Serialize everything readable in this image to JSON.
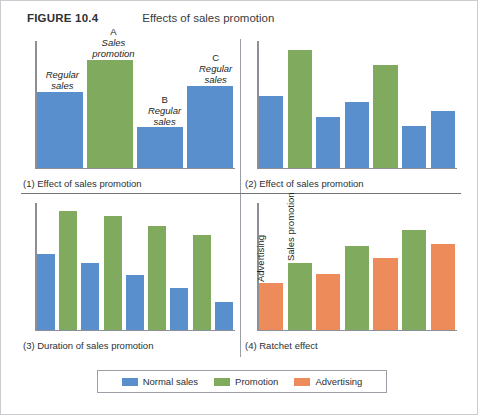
{
  "header": {
    "figure_number": "FIGURE 10.4",
    "title": "Effects of sales promotion"
  },
  "colors": {
    "normal_sales": "#5a8fcd",
    "promotion": "#80ab5f",
    "advertising": "#ed8b5b",
    "axis": "#8a9096",
    "border": "#c9ccd0"
  },
  "legend": {
    "items": [
      {
        "label": "Normal sales",
        "color": "#5a8fcd",
        "key": "normal"
      },
      {
        "label": "Promotion",
        "color": "#80ab5f",
        "key": "promotion"
      },
      {
        "label": "Advertising",
        "color": "#ed8b5b",
        "key": "advertising"
      }
    ]
  },
  "chart_data": [
    {
      "type": "bar",
      "id": "panel-1",
      "title": "(1) Effect of sales promotion",
      "xlabel": "",
      "ylabel": "",
      "ylim": [
        0,
        100
      ],
      "grid": false,
      "legend_position": "external-bottom",
      "categories": [
        "1",
        "2",
        "3",
        "4"
      ],
      "values": [
        60,
        85,
        32,
        65
      ],
      "series_keys": [
        "normal",
        "promotion",
        "normal",
        "normal"
      ],
      "annotations": [
        {
          "tag": "",
          "text": "Regular\nsales",
          "bar_index": 0
        },
        {
          "tag": "A",
          "text": "Sales\npromotion",
          "bar_index": 1
        },
        {
          "tag": "B",
          "text": "Regular\nsales",
          "bar_index": 2
        },
        {
          "tag": "C",
          "text": "Regular\nsales",
          "bar_index": 3
        }
      ]
    },
    {
      "type": "bar",
      "id": "panel-2",
      "title": "(2) Effect of sales promotion",
      "xlabel": "",
      "ylabel": "",
      "ylim": [
        0,
        100
      ],
      "grid": false,
      "legend_position": "external-bottom",
      "categories": [
        "1",
        "2",
        "3",
        "4",
        "5",
        "6",
        "7"
      ],
      "values": [
        57,
        93,
        40,
        52,
        81,
        33,
        45
      ],
      "series_keys": [
        "normal",
        "promotion",
        "normal",
        "normal",
        "promotion",
        "normal",
        "normal"
      ],
      "annotations": []
    },
    {
      "type": "bar",
      "id": "panel-3",
      "title": "(3) Duration of sales promotion",
      "xlabel": "",
      "ylabel": "",
      "ylim": [
        0,
        100
      ],
      "grid": false,
      "legend_position": "external-bottom",
      "categories": [
        "1",
        "2",
        "3",
        "4",
        "5",
        "6",
        "7",
        "8",
        "9"
      ],
      "values": [
        60,
        94,
        53,
        90,
        43,
        82,
        33,
        75,
        22
      ],
      "series_keys": [
        "normal",
        "promotion",
        "normal",
        "promotion",
        "normal",
        "promotion",
        "normal",
        "promotion",
        "normal"
      ],
      "annotations": []
    },
    {
      "type": "bar",
      "id": "panel-4",
      "title": "(4) Ratchet effect",
      "xlabel": "",
      "ylabel": "",
      "ylim": [
        0,
        100
      ],
      "grid": false,
      "legend_position": "external-bottom",
      "categories": [
        "1",
        "2",
        "3",
        "4",
        "5",
        "6",
        "7"
      ],
      "values": [
        37,
        53,
        44,
        66,
        57,
        79,
        68
      ],
      "series_keys": [
        "advertising",
        "promotion",
        "advertising",
        "promotion",
        "advertising",
        "promotion",
        "advertising"
      ],
      "annotations": [
        {
          "tag": "",
          "text": "Advertising",
          "bar_index": 0,
          "rotated": true
        },
        {
          "tag": "",
          "text": "Sales promotion",
          "bar_index": 1,
          "rotated": true
        }
      ]
    }
  ]
}
